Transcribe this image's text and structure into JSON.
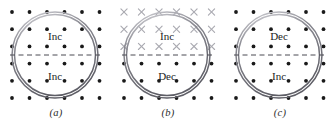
{
  "figure": {
    "title": "",
    "background_color": "#ffffff",
    "panel_count": 3,
    "grid": {
      "columns": 6,
      "rows": 6,
      "x_start": 12,
      "x_step": 17.5,
      "y_start": 12,
      "y_step": 17.2
    },
    "circle": {
      "center_x": 55,
      "center_y": 55,
      "outer_radius": 43,
      "inner_radius": 40.5,
      "ring_color": "#8a8a92",
      "ring_highlight": "#d8d8dd",
      "ring_shadow": "#5e5e66"
    },
    "divider": {
      "style": "dashed",
      "color": "#4a4a52",
      "y": 55,
      "x_start": 10,
      "x_end": 100
    },
    "markers": {
      "dot_color": "#1a1a1a",
      "dot_radius": 1.9,
      "cross_color": "#a9a9b0",
      "cross_size": 3.1
    }
  },
  "panels": [
    {
      "id": "panel-a",
      "caption": "(a)",
      "field_top": "dot",
      "field_bottom": "dot",
      "label_top": "Inc",
      "label_bottom": "Inc",
      "x_offset": 0
    },
    {
      "id": "panel-b",
      "caption": "(b)",
      "field_top": "cross",
      "field_bottom": "dot",
      "label_top": "Inc",
      "label_bottom": "Dec",
      "x_offset": 112
    },
    {
      "id": "panel-c",
      "caption": "(c)",
      "field_top": "dot",
      "field_bottom": "dot",
      "label_top": "Dec",
      "label_bottom": "Inc",
      "x_offset": 224
    }
  ]
}
